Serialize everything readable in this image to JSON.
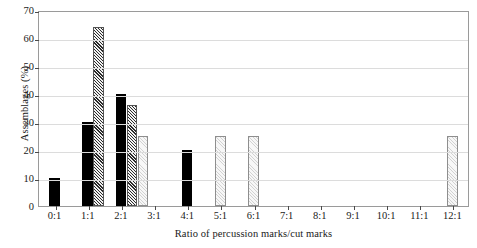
{
  "chart_data": {
    "type": "bar",
    "title": "",
    "xlabel": "Ratio of percussion marks/cut marks",
    "ylabel": "Assemblages (%)",
    "categories": [
      "0:1",
      "1:1",
      "2:1",
      "3:1",
      "4:1",
      "5:1",
      "6:1",
      "7:1",
      "8:1",
      "9:1",
      "10:1",
      "11:1",
      "12:1"
    ],
    "ylim": [
      0,
      70
    ],
    "yticks": [
      0,
      10,
      20,
      30,
      40,
      50,
      60,
      70
    ],
    "grid": "horizontal",
    "legend": "none",
    "series": [
      {
        "name": "black",
        "style": "solid-black",
        "color": "#000000",
        "values": [
          10,
          30,
          40,
          0,
          20,
          0,
          0,
          0,
          0,
          0,
          0,
          0,
          0
        ]
      },
      {
        "name": "hatched",
        "style": "dark-crosshatch",
        "color": "#2b2b2b",
        "values": [
          0,
          64,
          36,
          0,
          0,
          0,
          0,
          0,
          0,
          0,
          0,
          0,
          0
        ]
      },
      {
        "name": "light-gray",
        "style": "light-stipple",
        "color": "#d2d2d2",
        "values": [
          0,
          0,
          25,
          0,
          0,
          25,
          25,
          0,
          0,
          0,
          0,
          0,
          25
        ]
      }
    ]
  },
  "axis": {
    "y_title": "Assemblages (%)",
    "x_title": "Ratio of percussion marks/cut marks",
    "y_tick_labels": [
      "0",
      "10",
      "20",
      "30",
      "40",
      "50",
      "60",
      "70"
    ],
    "x_tick_labels": [
      "0:1",
      "1:1",
      "2:1",
      "3:1",
      "4:1",
      "5:1",
      "6:1",
      "7:1",
      "8:1",
      "9:1",
      "10:1",
      "11:1",
      "12:1"
    ]
  }
}
